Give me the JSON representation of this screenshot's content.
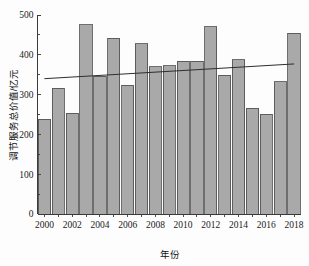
{
  "chart_data": {
    "type": "bar",
    "title": "",
    "subtitle": "",
    "xlabel": "年份",
    "ylabel": "调节服务总价值/亿元",
    "categories": [
      2000,
      2001,
      2002,
      2003,
      2004,
      2005,
      2006,
      2007,
      2008,
      2009,
      2010,
      2011,
      2012,
      2013,
      2014,
      2015,
      2016,
      2017,
      2018
    ],
    "values": [
      238,
      316,
      253,
      476,
      346,
      442,
      324,
      428,
      370,
      372,
      384,
      384,
      470,
      349,
      387,
      266,
      251,
      332,
      454
    ],
    "series": [
      {
        "name": "调节服务总价值",
        "type": "bar",
        "values": [
          238,
          316,
          253,
          476,
          346,
          442,
          324,
          428,
          370,
          372,
          384,
          384,
          470,
          349,
          387,
          266,
          251,
          332,
          454
        ]
      },
      {
        "name": "趋势线",
        "type": "line",
        "x": [
          2000,
          2018
        ],
        "values": [
          340,
          377
        ]
      }
    ],
    "xlim": [
      1999.5,
      2018.5
    ],
    "ylim": [
      0,
      500
    ],
    "ytick_labels": [
      "0",
      "100",
      "200",
      "300",
      "400",
      "500"
    ],
    "ytick_values": [
      0,
      100,
      200,
      300,
      400,
      500
    ],
    "yminor_step": 50,
    "xtick_labels": [
      "2000",
      "2002",
      "2004",
      "2006",
      "2008",
      "2010",
      "2012",
      "2014",
      "2016",
      "2018"
    ],
    "xtick_values": [
      2000,
      2002,
      2004,
      2006,
      2008,
      2010,
      2012,
      2014,
      2016,
      2018
    ],
    "grid": false,
    "legend": "none",
    "bar_fill_color": "#a9a9a9",
    "bar_edge_color": "#4a4a4a",
    "trend_line_color": "#2e2e2e",
    "axis_color": "#3a3a3a",
    "background_color": "#fdfdfd"
  }
}
